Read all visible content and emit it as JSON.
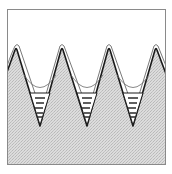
{
  "diagram": {
    "type": "cross-section",
    "frame": {
      "x": 7,
      "y": 9,
      "width": 159,
      "height": 156
    },
    "colors": {
      "frame": "#8a8a8a",
      "solid_fill": "#d9d9d9",
      "solid_hatch": "#bdbdbd",
      "outline": "#1a1a1a",
      "film_line": "#555555",
      "liquid_fill": "#ffffff",
      "liquid_dash": "#1a1a1a",
      "background": "#ffffff"
    },
    "peaks": [
      {
        "x": 16,
        "y": 49
      },
      {
        "x": 62,
        "y": 49
      },
      {
        "x": 109,
        "y": 49
      },
      {
        "x": 156,
        "y": 49
      }
    ],
    "valleys": [
      {
        "x": 40,
        "y": 126,
        "liquid_top": 93,
        "liquid_half_width": 13
      },
      {
        "x": 87,
        "y": 126,
        "liquid_top": 93,
        "liquid_half_width": 13
      },
      {
        "x": 133,
        "y": 126,
        "liquid_top": 93,
        "liquid_half_width": 13
      }
    ],
    "edge_left_y": 70,
    "edge_right_y": 72
  }
}
